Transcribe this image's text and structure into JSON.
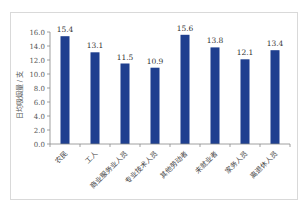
{
  "chart_data": {
    "type": "bar",
    "title": "",
    "xlabel": "",
    "ylabel": "日均吸烟量 / 支",
    "categories": [
      "农民",
      "工人",
      "商业服务业人员",
      "专业技术人员",
      "其他劳动者",
      "未就业者",
      "家务人员",
      "离退休人员"
    ],
    "values": [
      15.4,
      13.1,
      11.5,
      10.9,
      15.6,
      13.8,
      12.1,
      13.4
    ],
    "value_labels": [
      "15.4",
      "13.1",
      "11.5",
      "10.9",
      "15.6",
      "13.8",
      "12.1",
      "13.4"
    ],
    "ylim": [
      0,
      16
    ],
    "yticks": [
      "0.0",
      "2.0",
      "4.0",
      "6.0",
      "8.0",
      "10.0",
      "12.0",
      "14.0",
      "16.0"
    ],
    "grid": false,
    "legend": null,
    "bar_color": "#1f3f8f"
  }
}
